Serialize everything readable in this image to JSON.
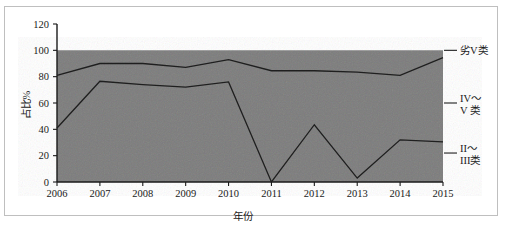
{
  "figure": {
    "frame_visible": true,
    "background_color": "#ffffff",
    "plot_fill_color": "#7c7c7c",
    "line_color": "#1f1f1f"
  },
  "chart_data": {
    "type": "area",
    "stacked": true,
    "title": "",
    "subtitle": "",
    "xlabel": "年份",
    "ylabel": "占比%",
    "x": [
      "2006",
      "2007",
      "2008",
      "2009",
      "2010",
      "2011",
      "2012",
      "2013",
      "2014",
      "2015"
    ],
    "xtick_labels": [
      "2006",
      "2007",
      "2008",
      "2009",
      "2010",
      "2011",
      "2012",
      "2013",
      "2014",
      "2015"
    ],
    "ytick_labels": [
      "0",
      "20",
      "40",
      "60",
      "80",
      "100",
      "120"
    ],
    "ytick_values": [
      0,
      20,
      40,
      60,
      80,
      100,
      120
    ],
    "ylim": [
      0,
      120
    ],
    "grid": false,
    "legend_position": "right-outside",
    "legend": [
      "劣V类",
      "IV～V类",
      "II～III类"
    ],
    "boundaries": [
      {
        "name": "II～III类 upper boundary",
        "values": [
          41,
          76.5,
          74,
          72,
          76,
          0,
          43.5,
          3,
          32,
          30.5
        ]
      },
      {
        "name": "IV～V类 upper boundary",
        "values": [
          81,
          90,
          90,
          87,
          93,
          84.5,
          84.5,
          83.5,
          81,
          94.5
        ]
      },
      {
        "name": "劣V类 upper boundary",
        "values": [
          100,
          100,
          100,
          100,
          100,
          100,
          100,
          100,
          100,
          100
        ]
      }
    ],
    "series": [
      {
        "name": "II～III类",
        "values": [
          41,
          76.5,
          74,
          72,
          76,
          0,
          43.5,
          3,
          32,
          30.5
        ]
      },
      {
        "name": "IV～V类",
        "values": [
          40,
          13.5,
          16,
          15,
          17,
          84.5,
          41,
          80.5,
          49,
          64
        ]
      },
      {
        "name": "劣V类",
        "values": [
          19,
          10,
          10,
          13,
          7,
          15.5,
          15.5,
          16.5,
          19,
          5.5
        ]
      }
    ]
  },
  "legend_items": [
    {
      "label": "劣V类",
      "label_line_1": "劣V类",
      "label_line_2": ""
    },
    {
      "label": "IV～V类",
      "label_line_1": "IV～",
      "label_line_2": "V 类"
    },
    {
      "label": "II～III类",
      "label_line_1": "II～",
      "label_line_2": "III类"
    }
  ]
}
